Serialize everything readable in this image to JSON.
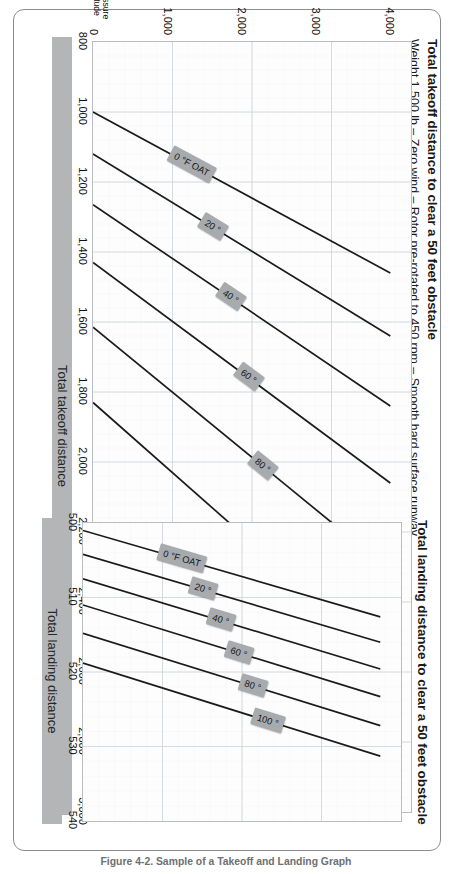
{
  "figure": {
    "caption": "Figure 4-2. Sample of a Takeoff and Landing Graph"
  },
  "charts": [
    {
      "id": "takeoff",
      "title": "Total takeoff distance to clear a 50 feet obstacle",
      "subtitle": "Weight 1,500 lb – Zero wind – Rotor pre-rotated to 450 rpm – Smooth hard surface runway",
      "x_axis_band_label": "Total takeoff distance",
      "y_axis_caption_line1": "Pressure",
      "y_axis_caption_line2": "altitude",
      "x_ticks": [
        "800",
        "1,000",
        "1,200",
        "1,400",
        "1,600",
        "1,800",
        "2,000",
        "2,200",
        "2,400",
        "2,600",
        "2,800",
        "3,000"
      ],
      "y_ticks": [
        "0",
        "1,000",
        "2,000",
        "3,000",
        "4,000"
      ],
      "curve_labels": [
        "0 °F OAT",
        "20 °",
        "40 °",
        "60 °",
        "80 °",
        "100 °"
      ]
    },
    {
      "id": "landing",
      "title": "Total landing distance to clear a 50 feet obstacle",
      "subtitle": "",
      "x_axis_band_label": "Total landing distance",
      "x_ticks": [
        "500",
        "510",
        "520",
        "530",
        "540"
      ],
      "curve_labels": [
        "0 °F OAT",
        "20 °",
        "40 °",
        "60 °",
        "80 °",
        "100 °"
      ]
    }
  ],
  "colors": {
    "curve": "#1b1b1b",
    "grid_minor": "#e3e8ec",
    "grid_major": "#ccd3d8",
    "axis_band": "#b3b5b7",
    "chip": "#a8abae",
    "frame": "#8a8d90"
  },
  "chart_data": [
    {
      "type": "line",
      "title": "Total takeoff distance to clear a 50 feet obstacle",
      "subtitle": "Weight 1,500 lb – Zero wind – Rotor pre-rotated to 450 rpm – Smooth hard surface runway",
      "xlabel": "Total takeoff distance",
      "ylabel": "Pressure altitude",
      "xlim": [
        800,
        3000
      ],
      "ylim": [
        0,
        4300
      ],
      "xticks": [
        800,
        1000,
        1200,
        1400,
        1600,
        1800,
        2000,
        2200,
        2400,
        2600,
        2800,
        3000
      ],
      "yticks": [
        0,
        1000,
        2000,
        3000,
        4000
      ],
      "grid": true,
      "legend": "inline-labels",
      "series": [
        {
          "name": "0 °F OAT",
          "x": [
            1000,
            1460
          ],
          "y": [
            0,
            4020
          ]
        },
        {
          "name": "20 °",
          "x": [
            1120,
            1640
          ],
          "y": [
            0,
            4020
          ]
        },
        {
          "name": "40 °",
          "x": [
            1265,
            1840
          ],
          "y": [
            0,
            4020
          ]
        },
        {
          "name": "60 °",
          "x": [
            1430,
            2060
          ],
          "y": [
            0,
            4020
          ]
        },
        {
          "name": "80 °",
          "x": [
            1615,
            2310
          ],
          "y": [
            0,
            4020
          ]
        },
        {
          "name": "100 °",
          "x": [
            1830,
            2580
          ],
          "y": [
            0,
            4020
          ]
        }
      ]
    },
    {
      "type": "line",
      "title": "Total landing distance to clear a 50 feet obstacle",
      "xlabel": "Total landing distance",
      "ylabel": "Pressure altitude",
      "xlim": [
        500,
        540
      ],
      "ylim": [
        0,
        4300
      ],
      "xticks": [
        500,
        510,
        520,
        530,
        540
      ],
      "yticks": [
        0,
        1000,
        2000,
        3000,
        4000
      ],
      "grid": true,
      "legend": "inline-labels",
      "series": [
        {
          "name": "0 °F OAT",
          "x": [
            501.0,
            512.6
          ],
          "y": [
            0,
            4020
          ]
        },
        {
          "name": "20 °",
          "x": [
            504.2,
            516.0
          ],
          "y": [
            0,
            4020
          ]
        },
        {
          "name": "40 °",
          "x": [
            507.5,
            519.6
          ],
          "y": [
            0,
            4020
          ]
        },
        {
          "name": "60 °",
          "x": [
            511.0,
            523.3
          ],
          "y": [
            0,
            4020
          ]
        },
        {
          "name": "80 °",
          "x": [
            514.8,
            527.2
          ],
          "y": [
            0,
            4020
          ]
        },
        {
          "name": "100 °",
          "x": [
            518.8,
            531.3
          ],
          "y": [
            0,
            4020
          ]
        }
      ]
    }
  ]
}
